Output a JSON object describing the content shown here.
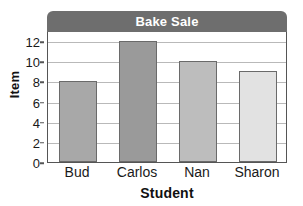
{
  "chart_data": {
    "type": "bar",
    "title": "Bake Sale",
    "xlabel": "Student",
    "ylabel": "Item",
    "categories": [
      "Bud",
      "Carlos",
      "Nan",
      "Sharon"
    ],
    "values": [
      8,
      12,
      10,
      9
    ],
    "ylim": [
      0,
      13
    ],
    "yticks": [
      0,
      2,
      4,
      6,
      8,
      10,
      12
    ],
    "ytick_labels": [
      "0",
      "2",
      "4",
      "6",
      "8",
      "10",
      "12"
    ],
    "grid": "horizontal",
    "legend": "none",
    "bar_colors": [
      "#a8a8a8",
      "#9a9a9a",
      "#bdbdbd",
      "#e2e2e2"
    ],
    "bar_edge_color": "#6a6a6a",
    "title_bar_color": "#6e6e6e",
    "title_text_color": "#ffffff",
    "gridline_color": "#b9b9b9",
    "axis_color": "#555555",
    "background_color": "#ffffff"
  }
}
